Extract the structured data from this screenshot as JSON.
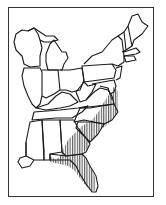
{
  "map": {
    "title": "Eastern United States range map",
    "region": "Eastern United States",
    "style": "black-and-white line map",
    "colors": {
      "background": "#ffffff",
      "frame": "#333333",
      "outline": "#1a1a1a",
      "hatch": "#333333"
    },
    "legend": [],
    "shaded_range": {
      "pattern": "vertical-hatching",
      "description": "Southeastern coastal plain from southern Maryland/Delaware through Virginia, North Carolina, South Carolina, Georgia and Florida panhandle to peninsular Florida",
      "areas": [
        "Delaware",
        "Maryland (eastern)",
        "Virginia (eastern)",
        "North Carolina (eastern)",
        "South Carolina",
        "Georgia (southeastern)",
        "Florida",
        "Alabama (southeastern corner)"
      ]
    },
    "states_shown": [
      "Wisconsin",
      "Michigan",
      "Illinois",
      "Indiana",
      "Ohio",
      "Kentucky",
      "Tennessee",
      "Mississippi",
      "Alabama",
      "Georgia",
      "Florida",
      "South Carolina",
      "North Carolina",
      "Virginia",
      "West Virginia",
      "Maryland",
      "Delaware",
      "Pennsylvania",
      "New Jersey",
      "New York",
      "Connecticut",
      "Rhode Island",
      "Massachusetts",
      "Vermont",
      "New Hampshire",
      "Maine",
      "Louisiana (eastern)"
    ]
  }
}
